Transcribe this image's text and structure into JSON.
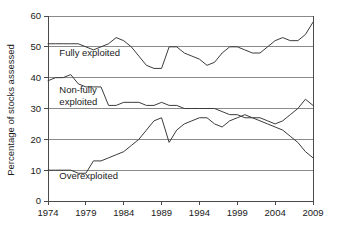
{
  "chart_data": {
    "type": "line",
    "title": "",
    "xlabel": "",
    "ylabel": "Percentage of stocks assessed",
    "xlim": [
      1974,
      2009
    ],
    "ylim": [
      0,
      60
    ],
    "ytick_labels": [
      "0",
      "10",
      "20",
      "30",
      "40",
      "50",
      "60"
    ],
    "yticks": [
      0,
      10,
      20,
      30,
      40,
      50,
      60
    ],
    "xtick_labels": [
      "1974",
      "1979",
      "1984",
      "1989",
      "1994",
      "1999",
      "2004",
      "2009"
    ],
    "xticks": [
      1974,
      1979,
      1984,
      1989,
      1994,
      1999,
      2004,
      2009
    ],
    "grid": "horizontal",
    "legend_position": "inline-annotations",
    "x": [
      1974,
      1975,
      1976,
      1977,
      1978,
      1979,
      1980,
      1981,
      1982,
      1983,
      1984,
      1985,
      1986,
      1987,
      1988,
      1989,
      1990,
      1991,
      1992,
      1993,
      1994,
      1995,
      1996,
      1997,
      1998,
      1999,
      2000,
      2001,
      2002,
      2003,
      2004,
      2005,
      2006,
      2007,
      2008,
      2009
    ],
    "series": [
      {
        "name": "Fully exploited",
        "label": "Fully exploited",
        "color": "#3b3b3b",
        "values": [
          51,
          51,
          51,
          51,
          51,
          50,
          49,
          50,
          51,
          53,
          52,
          50,
          47,
          44,
          43,
          43,
          50,
          50,
          48,
          47,
          46,
          44,
          45,
          48,
          50,
          50,
          49,
          48,
          48,
          50,
          52,
          53,
          52,
          52,
          54,
          58
        ]
      },
      {
        "name": "Non-fully exploited",
        "label": "Non-fully exploited",
        "label_lines": [
          "Non-fully",
          "exploited"
        ],
        "color": "#3b3b3b",
        "values": [
          39,
          40,
          40,
          41,
          38,
          37,
          37,
          37,
          31,
          31,
          32,
          32,
          32,
          31,
          31,
          32,
          31,
          31,
          30,
          30,
          30,
          30,
          30,
          29,
          28,
          28,
          27,
          27,
          27,
          26,
          25,
          26,
          28,
          30,
          33,
          31
        ]
      },
      {
        "name": "Overexploited",
        "label": "Overexploited",
        "color": "#3b3b3b",
        "values": [
          10,
          10,
          10,
          10,
          9,
          9,
          13,
          13,
          14,
          15,
          16,
          18,
          20,
          23,
          26,
          27,
          19,
          23,
          25,
          26,
          27,
          27,
          25,
          24,
          26,
          27,
          28,
          27,
          26,
          25,
          24,
          23,
          21,
          19,
          16,
          14
        ]
      }
    ],
    "annotations": [
      {
        "text": "Fully exploited",
        "x": 1975.5,
        "y": 47
      },
      {
        "text": "Non-fully exploited",
        "x": 1975.5,
        "y": 35
      },
      {
        "text": "Overexploited",
        "x": 1975.5,
        "y": 7
      }
    ]
  }
}
